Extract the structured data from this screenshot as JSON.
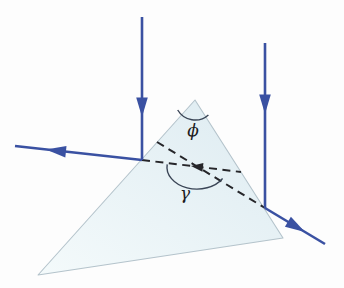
{
  "figure": {
    "name": "prism-ray-reflection-diagram",
    "labels": {
      "apex_angle": "ϕ",
      "ray_angle": "γ"
    },
    "colors": {
      "ray": "#3a51a2",
      "dashed": "#26262a",
      "arc": "#3a4556",
      "prism-fill-light": "#f4fafb",
      "prism-fill-dark": "#ddebf1",
      "prism-edge": "#b4c3cb",
      "background": "#fdfdfd",
      "label": "#1c1c1e"
    }
  }
}
